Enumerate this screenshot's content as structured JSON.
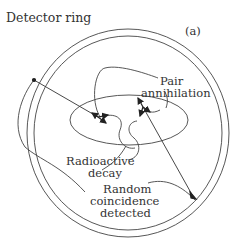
{
  "diagram": {
    "panel_label": "(a)",
    "labels": {
      "detector_ring": "Detector ring",
      "pair_annihilation_line1": "Pair",
      "pair_annihilation_line2": "annihilation",
      "radioactive_decay_line1": "Radioactive",
      "radioactive_decay_line2": "decay",
      "random_coincidence_line1": "Random",
      "random_coincidence_line2": "coincidence",
      "random_coincidence_line3": "detected"
    },
    "colors": {
      "line": "#333333",
      "background": "#ffffff"
    }
  }
}
